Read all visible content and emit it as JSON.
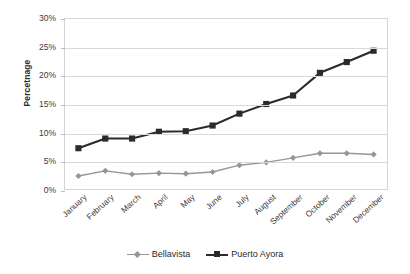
{
  "chart_data": {
    "type": "line",
    "title": "",
    "xlabel": "",
    "ylabel": "Percetnage",
    "categories": [
      "January",
      "February",
      "March",
      "April",
      "May",
      "June",
      "July",
      "August",
      "September",
      "October",
      "November",
      "December"
    ],
    "ylim": [
      0,
      30
    ],
    "ytick_labels": [
      "0%",
      "5%",
      "10%",
      "15%",
      "20%",
      "25%",
      "30%"
    ],
    "ytick_values": [
      0,
      5,
      10,
      15,
      20,
      25,
      30
    ],
    "grid": true,
    "legend_position": "bottom",
    "series": [
      {
        "name": "Bellavista",
        "color": "#969696",
        "marker": "diamond",
        "values": [
          2.3,
          3.2,
          2.6,
          2.8,
          2.7,
          3.0,
          4.2,
          4.7,
          5.5,
          6.3,
          6.3,
          6.1
        ]
      },
      {
        "name": "Puerto Ayora",
        "color": "#2b2b2b",
        "marker": "square",
        "values": [
          7.2,
          8.9,
          8.9,
          10.1,
          10.2,
          11.2,
          13.3,
          15.0,
          16.5,
          20.5,
          22.4,
          24.4
        ]
      }
    ]
  }
}
